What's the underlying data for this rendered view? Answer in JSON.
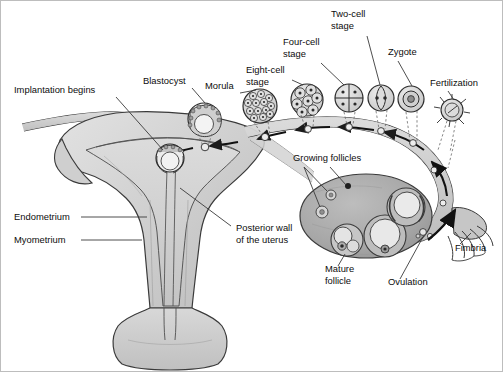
{
  "diagram": {
    "type": "anatomical-illustration",
    "canvas": {
      "width": 503,
      "height": 372
    },
    "palette": {
      "background": "#ffffff",
      "outline": "#2b2b2b",
      "uterus_fill": "#cfcfcf",
      "uterus_fill_light": "#dedede",
      "endometrium_fill": "#c2c2c2",
      "ovary_fill": "#ababab",
      "tube_fill": "#c9c9c9",
      "cell_fill": "#d9d9d9",
      "text": "#0d0d0d",
      "leader_line": "#3a3a3a",
      "frame": "#bdbdbd"
    },
    "labels": [
      {
        "id": "implantation-begins",
        "text": "Implantation begins",
        "lines": [
          "Implantation begins"
        ],
        "x": 14,
        "y": 93,
        "anchor": "start"
      },
      {
        "id": "blastocyst",
        "text": "Blastocyst",
        "lines": [
          "Blastocyst"
        ],
        "x": 143,
        "y": 84,
        "anchor": "start"
      },
      {
        "id": "morula",
        "text": "Morula",
        "lines": [
          "Morula"
        ],
        "x": 205,
        "y": 89,
        "anchor": "start"
      },
      {
        "id": "eight-cell-stage",
        "text": "Eight-cell stage",
        "lines": [
          "Eight-cell",
          "stage"
        ],
        "x": 246,
        "y": 73,
        "anchor": "start"
      },
      {
        "id": "four-cell-stage",
        "text": "Four-cell stage",
        "lines": [
          "Four-cell",
          "stage"
        ],
        "x": 283,
        "y": 45,
        "anchor": "start"
      },
      {
        "id": "two-cell-stage",
        "text": "Two-cell stage",
        "lines": [
          "Two-cell",
          "stage"
        ],
        "x": 331,
        "y": 17,
        "anchor": "start"
      },
      {
        "id": "zygote",
        "text": "Zygote",
        "lines": [
          "Zygote"
        ],
        "x": 388,
        "y": 55,
        "anchor": "start"
      },
      {
        "id": "fertilization",
        "text": "Fertilization",
        "lines": [
          "Fertilization"
        ],
        "x": 430,
        "y": 86,
        "anchor": "start"
      },
      {
        "id": "growing-follicles",
        "text": "Growing follicles",
        "lines": [
          "Growing follicles"
        ],
        "x": 293,
        "y": 161,
        "anchor": "start"
      },
      {
        "id": "endometrium",
        "text": "Endometrium",
        "lines": [
          "Endometrium"
        ],
        "x": 14,
        "y": 220,
        "anchor": "start"
      },
      {
        "id": "myometrium",
        "text": "Myometrium",
        "lines": [
          "Myometrium"
        ],
        "x": 14,
        "y": 243,
        "anchor": "start"
      },
      {
        "id": "posterior-wall-of-the-uterus",
        "text": "Posterior wall of the uterus",
        "lines": [
          "Posterior wall",
          "of the uterus"
        ],
        "x": 236,
        "y": 231,
        "anchor": "start"
      },
      {
        "id": "mature-follicle",
        "text": "Mature follicle",
        "lines": [
          "Mature",
          "follicle"
        ],
        "x": 325,
        "y": 272,
        "anchor": "start"
      },
      {
        "id": "ovulation",
        "text": "Ovulation",
        "lines": [
          "Ovulation"
        ],
        "x": 388,
        "y": 285,
        "anchor": "start"
      },
      {
        "id": "fimbria",
        "text": "Fimbria",
        "lines": [
          "Fimbria"
        ],
        "x": 455,
        "y": 251,
        "anchor": "start"
      }
    ],
    "stages": [
      {
        "id": "blastocyst-cell",
        "label": "Blastocyst",
        "cx": 204,
        "cy": 119,
        "r": 16,
        "kind": "blastocyst"
      },
      {
        "id": "implanting-blastocyst",
        "label": "Implantation begins",
        "cx": 170,
        "cy": 158,
        "r": 14,
        "kind": "implanting"
      },
      {
        "id": "morula-cell",
        "label": "Morula",
        "cx": 260,
        "cy": 106,
        "r": 17,
        "kind": "morula"
      },
      {
        "id": "eight-cell",
        "label": "Eight-cell stage",
        "cx": 307,
        "cy": 100,
        "r": 16,
        "kind": "eight"
      },
      {
        "id": "four-cell",
        "label": "Four-cell stage",
        "cx": 349,
        "cy": 98,
        "r": 14,
        "kind": "four"
      },
      {
        "id": "two-cell",
        "label": "Two-cell stage",
        "cx": 381,
        "cy": 98,
        "r": 13,
        "kind": "two"
      },
      {
        "id": "zygote-cell",
        "label": "Zygote",
        "cx": 411,
        "cy": 99,
        "r": 13,
        "kind": "zygote"
      },
      {
        "id": "fertilization-cell",
        "label": "Fertilization",
        "cx": 452,
        "cy": 110,
        "r": 11,
        "kind": "fertilization"
      }
    ],
    "follicles": [
      {
        "id": "growing-follicle-small-1",
        "cx": 331,
        "cy": 195,
        "r": 5
      },
      {
        "id": "growing-follicle-small-2",
        "cx": 322,
        "cy": 212,
        "r": 6
      },
      {
        "id": "growing-follicle-dot",
        "cx": 348,
        "cy": 186,
        "r": 3
      },
      {
        "id": "mature-follicle-main",
        "cx": 347,
        "cy": 240,
        "r": 16
      },
      {
        "id": "antral-follicle",
        "cx": 385,
        "cy": 236,
        "r": 21
      },
      {
        "id": "corpus-luteum",
        "cx": 406,
        "cy": 207,
        "r": 19
      }
    ],
    "travel_direction": "ovary to uterus (right to left along the fallopian tube)"
  }
}
